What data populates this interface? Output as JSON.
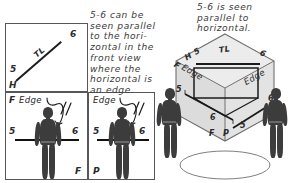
{
  "figure": {
    "title_text_right": "5-6 is seen\nparallel to\nhorizontal.",
    "caption_left": "5-6 can be\nseen parallel\nto the hori-\nzontal in the\nfront view\nwhere the\nhorizontal is\nan edge."
  },
  "panels": {
    "h_view": {
      "name": "horizontal-view-panel",
      "plane_label": "H",
      "point_start": "5",
      "point_end": "6",
      "line_label": "TL"
    },
    "f_view": {
      "name": "front-view-panel",
      "plane_label_top": "F",
      "edge_label": "Edge",
      "point_start": "5",
      "point_end": "6",
      "plane_label_bottom": "F"
    },
    "p_view": {
      "name": "profile-view-panel",
      "edge_label": "Edge",
      "point_start": "5",
      "point_end": "6",
      "plane_label_bottom": "P"
    }
  },
  "glass_box": {
    "name": "isometric-glass-box",
    "top_plane_label": "H",
    "left_plane_label": "F",
    "left_edge_label": "Edge",
    "right_edge_label": "Edge",
    "bottom_left_label": "F",
    "bottom_right_label": "P",
    "top_point_start": "5",
    "top_point_end": "6",
    "top_line_label": "TL",
    "front_point_start": "5",
    "front_point_end": "6",
    "profile_point_start": "5",
    "profile_point_end": "6"
  },
  "colors": {
    "ink": "#1d1d1d",
    "frame": "#55575a",
    "silhouette": "#3c3c3c",
    "face_light": "#ececec",
    "face_mid": "#e3e3e3",
    "face_dark": "#dcdcdc",
    "paper": "#ffffff"
  }
}
